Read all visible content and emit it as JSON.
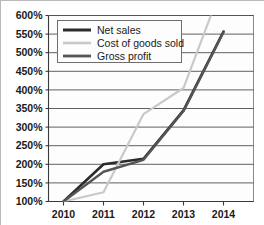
{
  "chart_data": {
    "type": "line",
    "title": "",
    "xlabel": "",
    "ylabel": "",
    "categories": [
      "2010",
      "2011",
      "2012",
      "2013",
      "2014"
    ],
    "x": [
      2010,
      2011,
      2012,
      2013,
      2014
    ],
    "ylim": [
      100,
      600
    ],
    "ytick_values": [
      100,
      150,
      200,
      250,
      300,
      350,
      400,
      450,
      500,
      550,
      600
    ],
    "ytick_labels": [
      "100%",
      "150%",
      "200%",
      "250%",
      "300%",
      "350%",
      "400%",
      "450%",
      "500%",
      "550%",
      "600%"
    ],
    "xtick_labels": [
      "2010",
      "2011",
      "2012",
      "2013",
      "2014"
    ],
    "grid": true,
    "grid_axis": "y",
    "legend_position": "top-left",
    "series": [
      {
        "name": "Net sales",
        "color": "#2b2b2b",
        "width": 2.6,
        "values": [
          100,
          200,
          215,
          345,
          557
        ],
        "clipped": false
      },
      {
        "name": "Cost of goods sold",
        "color": "#c9c9c9",
        "width": 2.2,
        "values": [
          100,
          125,
          335,
          405,
          690
        ],
        "clipped": true,
        "clip_note": "exits top of plot above 600% between 2013 and 2014"
      },
      {
        "name": "Gross profit",
        "color": "#555555",
        "width": 2.4,
        "values": [
          100,
          180,
          212,
          343,
          555
        ],
        "clipped": false
      }
    ]
  },
  "legend": {
    "entries": [
      {
        "label": "Net sales"
      },
      {
        "label": "Cost of goods sold"
      },
      {
        "label": "Gross profit"
      }
    ]
  },
  "axes": {
    "y_labels": [
      "600%",
      "550%",
      "500%",
      "450%",
      "400%",
      "350%",
      "300%",
      "250%",
      "200%",
      "150%",
      "100%"
    ],
    "x_labels": [
      "2010",
      "2011",
      "2012",
      "2013",
      "2014"
    ]
  },
  "colors": {
    "net_sales": "#2b2b2b",
    "cost_of_goods_sold": "#c9c9c9",
    "gross_profit": "#555555",
    "gridline": "#4d4d4d",
    "plot_background": "#fdfdfd",
    "frame": "#b9b9b9"
  }
}
